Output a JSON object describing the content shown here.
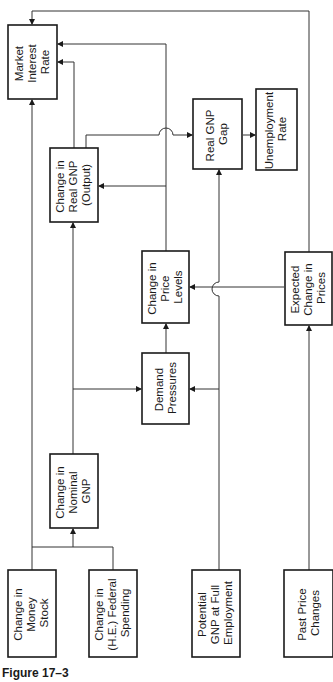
{
  "figure": {
    "caption": "Figure 17–3",
    "nodes": {
      "market_interest_rate": {
        "lines": [
          "Market",
          "Interest",
          "Rate"
        ]
      },
      "change_real_gnp": {
        "lines": [
          "Change in",
          "Real GNP",
          "(Output)"
        ]
      },
      "real_gnp_gap": {
        "lines": [
          "Real GNP",
          "Gap"
        ]
      },
      "unemployment_rate": {
        "lines": [
          "Unemployment",
          "Rate"
        ]
      },
      "change_price_levels": {
        "lines": [
          "Change in",
          "Price",
          "Levels"
        ]
      },
      "expected_change_prices": {
        "lines": [
          "Expected",
          "Change in",
          "Prices"
        ]
      },
      "demand_pressures": {
        "lines": [
          "Demand",
          "Pressures"
        ]
      },
      "change_nominal_gnp": {
        "lines": [
          "Change in",
          "Nominal",
          "GNP"
        ]
      },
      "change_money_stock": {
        "lines": [
          "Change in",
          "Money",
          "Stock"
        ]
      },
      "change_federal_spending": {
        "lines": [
          "Change in",
          "(H.E.) Federal",
          "Spending"
        ]
      },
      "potential_gnp": {
        "lines": [
          "Potential",
          "GNP at Full",
          "Employment"
        ]
      },
      "past_price_changes": {
        "lines": [
          "Past Price",
          "Changes"
        ]
      }
    },
    "edges": [
      {
        "from": "Change in Money Stock",
        "to": "Change in Nominal GNP"
      },
      {
        "from": "Change in (H.E.) Federal Spending",
        "to": "Change in Nominal GNP"
      },
      {
        "from": "Change in Money Stock",
        "to": "Market Interest Rate"
      },
      {
        "from": "Change in Nominal GNP",
        "to": "Demand Pressures"
      },
      {
        "from": "Change in Nominal GNP",
        "to": "Change in Real GNP (Output)"
      },
      {
        "from": "Potential GNP at Full Employment",
        "to": "Demand Pressures"
      },
      {
        "from": "Potential GNP at Full Employment",
        "to": "Real GNP Gap"
      },
      {
        "from": "Demand Pressures",
        "to": "Change in Price Levels"
      },
      {
        "from": "Change in Price Levels",
        "to": "Change in Real GNP (Output)"
      },
      {
        "from": "Change in Price Levels",
        "to": "Market Interest Rate"
      },
      {
        "from": "Change in Real GNP (Output)",
        "to": "Market Interest Rate"
      },
      {
        "from": "Change in Real GNP (Output)",
        "to": "Real GNP Gap"
      },
      {
        "from": "Real GNP Gap",
        "to": "Unemployment Rate"
      },
      {
        "from": "Past Price Changes",
        "to": "Expected Change in Prices"
      },
      {
        "from": "Expected Change in Prices",
        "to": "Change in Price Levels"
      },
      {
        "from": "Expected Change in Prices",
        "to": "Market Interest Rate"
      }
    ]
  }
}
